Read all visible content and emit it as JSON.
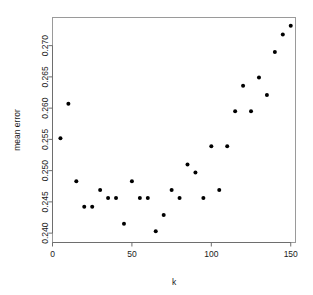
{
  "chart_data": {
    "type": "scatter",
    "title": "",
    "xlabel": "k",
    "ylabel": "mean error",
    "x": [
      5,
      10,
      15,
      20,
      25,
      30,
      35,
      40,
      45,
      50,
      55,
      60,
      65,
      70,
      75,
      80,
      85,
      90,
      95,
      100,
      105,
      110,
      115,
      120,
      125,
      130,
      135,
      140,
      145,
      150
    ],
    "y": [
      0.2552,
      0.2607,
      0.2483,
      0.2442,
      0.2442,
      0.2469,
      0.2456,
      0.2456,
      0.2415,
      0.2483,
      0.2456,
      0.2456,
      0.2403,
      0.2429,
      0.2469,
      0.2456,
      0.251,
      0.2497,
      0.2456,
      0.2539,
      0.2469,
      0.2539,
      0.2595,
      0.2636,
      0.2595,
      0.2649,
      0.2621,
      0.269,
      0.2718,
      0.2732
    ],
    "xlim": [
      0,
      153
    ],
    "ylim": [
      0.2385,
      0.2745
    ],
    "xticks": [
      0,
      50,
      100,
      150
    ],
    "xtick_labels": [
      "0",
      "50",
      "100",
      "150"
    ],
    "yticks": [
      0.24,
      0.245,
      0.25,
      0.255,
      0.26,
      0.265,
      0.27
    ],
    "ytick_labels": [
      "0.240",
      "0.245",
      "0.250",
      "0.255",
      "0.260",
      "0.265",
      "0.270"
    ],
    "grid": false,
    "legend": null,
    "point_color": "#000000",
    "point_size": 2.0,
    "frame_color": "#9a9a9a"
  }
}
